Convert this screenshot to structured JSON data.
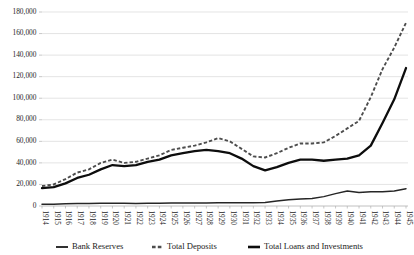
{
  "chart_data": {
    "type": "line",
    "title": "",
    "xlabel": "",
    "ylabel": "",
    "ylim": [
      0,
      180000
    ],
    "yticks": [
      "0",
      "20,000",
      "40,000",
      "60,000",
      "80,000",
      "100,000",
      "120,000",
      "140,000",
      "160,000",
      "180,000"
    ],
    "ytick_values": [
      0,
      20000,
      40000,
      60000,
      80000,
      100000,
      120000,
      140000,
      160000,
      180000
    ],
    "grid": true,
    "legend_position": "bottom",
    "categories": [
      "1914",
      "1915",
      "1916",
      "1917",
      "1918",
      "1919",
      "1920",
      "1921",
      "1922",
      "1923",
      "1924",
      "1925",
      "1926",
      "1927",
      "1928",
      "1929",
      "1930",
      "1931",
      "1932",
      "1933",
      "1934",
      "1935",
      "1936",
      "1937",
      "1938",
      "1939",
      "1940",
      "1941",
      "1942",
      "1943",
      "1944",
      "1945"
    ],
    "series": [
      {
        "name": "Bank Reserves",
        "style": "solid-thin",
        "color": "#262626",
        "values": [
          1600,
          1700,
          2000,
          2300,
          2400,
          2500,
          2600,
          2500,
          2400,
          2500,
          2600,
          2700,
          2700,
          2800,
          2800,
          2900,
          2900,
          3000,
          3100,
          3200,
          4600,
          5700,
          6600,
          7000,
          8700,
          11500,
          14000,
          12500,
          13200,
          13200,
          14000,
          16000
        ]
      },
      {
        "name": "Total Deposits",
        "style": "dashed",
        "color": "#4d4d4d",
        "values": [
          18500,
          20000,
          25000,
          31000,
          34000,
          40000,
          43000,
          40000,
          41000,
          44000,
          47000,
          52000,
          54000,
          56000,
          59000,
          63000,
          60000,
          53000,
          46000,
          45000,
          49000,
          54000,
          58000,
          58000,
          59000,
          65000,
          72000,
          79000,
          101000,
          127000,
          147000,
          170000
        ]
      },
      {
        "name": "Total Loans and Investments",
        "style": "solid-thick",
        "color": "#0d0d0d",
        "values": [
          16500,
          17500,
          21000,
          26000,
          29000,
          34000,
          38000,
          37000,
          38000,
          41000,
          43000,
          47000,
          49000,
          51000,
          52000,
          51000,
          49000,
          44000,
          37000,
          33000,
          36000,
          40000,
          43000,
          43000,
          42000,
          43000,
          44000,
          47000,
          56000,
          77000,
          99000,
          128000
        ]
      }
    ]
  },
  "legend": {
    "items": [
      {
        "label": "Bank Reserves"
      },
      {
        "label": "Total Deposits"
      },
      {
        "label": "Total Loans and Investments"
      }
    ]
  }
}
